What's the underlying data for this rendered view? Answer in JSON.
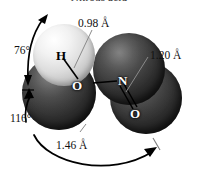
{
  "figure": {
    "caption": "Nitrous acid",
    "molecule_name": "nitrous acid",
    "formula_label": "HONO"
  },
  "atoms": [
    {
      "id": "hydrogen",
      "symbol": "H",
      "kind": "hydrogen",
      "color": "#e0e0e0"
    },
    {
      "id": "oxygen-hydroxyl",
      "symbol": "O",
      "kind": "oxygen",
      "color": "#2b2b2b"
    },
    {
      "id": "nitrogen",
      "symbol": "N",
      "kind": "nitrogen",
      "color": "#2b2b2b"
    },
    {
      "id": "oxygen-carbonyl",
      "symbol": "O",
      "kind": "oxygen",
      "color": "#2b2b2b"
    }
  ],
  "bond_lengths": [
    {
      "id": "h-o",
      "value": "0.98 Å"
    },
    {
      "id": "n-o-double",
      "value": "1.20 Å"
    },
    {
      "id": "o-n",
      "value": "1.46 Å"
    }
  ],
  "bond_angles": [
    {
      "id": "h-o-n",
      "value": "76°"
    },
    {
      "id": "o-n-o",
      "value": "116°"
    }
  ],
  "colors": {
    "background": "#ffffff",
    "hydrogen_sphere": "#e2e2e2",
    "heavy_sphere": "#262626",
    "annotation": "#111111"
  }
}
